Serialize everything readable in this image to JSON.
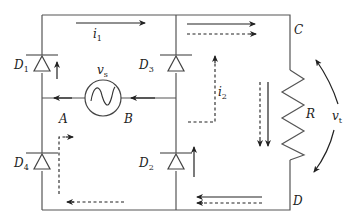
{
  "diagram": {
    "type": "full-wave bridge rectifier circuit",
    "nodes": {
      "A": "A",
      "B": "B",
      "C": "C",
      "D": "D"
    },
    "diodes": [
      {
        "id": "D1",
        "label": "D",
        "sub": "1",
        "position": "top-left"
      },
      {
        "id": "D3",
        "label": "D",
        "sub": "3",
        "position": "top-middle"
      },
      {
        "id": "D4",
        "label": "D",
        "sub": "4",
        "position": "bottom-left"
      },
      {
        "id": "D2",
        "label": "D",
        "sub": "2",
        "position": "bottom-middle"
      }
    ],
    "source": {
      "label": "v",
      "sub": "s",
      "symbol": "sine-wave-ac-source-icon"
    },
    "resistor": {
      "label": "R"
    },
    "output_voltage": {
      "label": "v",
      "sub": "t"
    },
    "currents": [
      {
        "label": "i",
        "sub": "1",
        "style": "solid",
        "path": "A → D1 → top → C → R → D → bottom → D2 → B"
      },
      {
        "label": "i",
        "sub": "2",
        "style": "dashed",
        "path": "B → D3 → top → C → R → D → bottom → D4 → A"
      }
    ],
    "colors": {
      "wire": "#555555",
      "arrow": "#222222",
      "background": "#ffffff"
    }
  }
}
